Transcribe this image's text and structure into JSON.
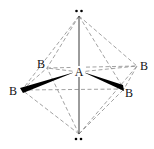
{
  "diagram": {
    "central_atom": {
      "label": "A"
    },
    "ligands": [
      {
        "id": "back-left",
        "label": "B"
      },
      {
        "id": "back-right",
        "label": "B"
      },
      {
        "id": "front-left",
        "label": "B"
      },
      {
        "id": "front-right",
        "label": "B"
      }
    ],
    "lone_pairs": [
      {
        "id": "top",
        "symbol": "••"
      },
      {
        "id": "bottom",
        "symbol": "••"
      }
    ],
    "colors": {
      "line": "#111111",
      "dashed": "#888888",
      "background": "#ffffff"
    }
  }
}
